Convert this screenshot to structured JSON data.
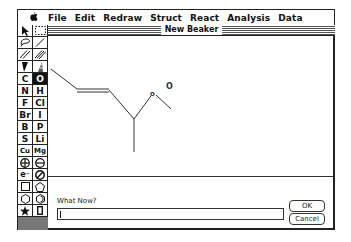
{
  "menubar": {
    "apple": "",
    "items": [
      {
        "label": "File"
      },
      {
        "label": "Edit"
      },
      {
        "label": "Redraw"
      },
      {
        "label": "Struct"
      },
      {
        "label": "React"
      },
      {
        "label": "Analysis"
      },
      {
        "label": "Data"
      }
    ]
  },
  "palette": {
    "tools": [
      {
        "name": "arrow-tool",
        "glyph": "arrow-icon"
      },
      {
        "name": "marquee-tool",
        "glyph": "marquee-icon"
      },
      {
        "name": "lasso-tool",
        "glyph": "lasso-icon"
      },
      {
        "name": "single-bond-tool",
        "glyph": "single-bond-icon"
      },
      {
        "name": "double-bond-tool",
        "glyph": "double-bond-icon"
      },
      {
        "name": "triple-bond-tool",
        "glyph": "triple-bond-icon"
      },
      {
        "name": "wedge-bond-tool",
        "glyph": "wedge-icon"
      },
      {
        "name": "hash-bond-tool",
        "glyph": "hash-wedge-icon"
      },
      {
        "name": "element-C",
        "label": "C"
      },
      {
        "name": "element-O",
        "label": "O",
        "selected": true
      },
      {
        "name": "element-N",
        "label": "N"
      },
      {
        "name": "element-H",
        "label": "H"
      },
      {
        "name": "element-F",
        "label": "F"
      },
      {
        "name": "element-Cl",
        "label": "Cl"
      },
      {
        "name": "element-Br",
        "label": "Br"
      },
      {
        "name": "element-I",
        "label": "I"
      },
      {
        "name": "element-B",
        "label": "B"
      },
      {
        "name": "element-P",
        "label": "P"
      },
      {
        "name": "element-S",
        "label": "S"
      },
      {
        "name": "element-Li",
        "label": "Li"
      },
      {
        "name": "element-Cu",
        "label": "Cu"
      },
      {
        "name": "element-Mg",
        "label": "Mg"
      },
      {
        "name": "positive-charge-tool",
        "glyph": "plus-circle-icon"
      },
      {
        "name": "negative-charge-tool",
        "glyph": "minus-circle-icon"
      },
      {
        "name": "electron-tool",
        "label": "e⁻"
      },
      {
        "name": "erase-tool",
        "glyph": "no-symbol-icon"
      },
      {
        "name": "square-ring-tool",
        "glyph": "square-icon"
      },
      {
        "name": "pentagon-ring-tool",
        "glyph": "pentagon-icon"
      },
      {
        "name": "hexagon-ring-tool",
        "glyph": "hexagon-icon"
      },
      {
        "name": "benzene-ring-tool",
        "glyph": "benzene-icon"
      },
      {
        "name": "star-tool",
        "glyph": "star-icon"
      },
      {
        "name": "rectangle-tool",
        "glyph": "rectangle-icon"
      }
    ]
  },
  "window": {
    "title": "New Beaker"
  },
  "molecule": {
    "atom_labels": [
      {
        "text": "o",
        "x": 152,
        "y": 72
      },
      {
        "text": "O",
        "x": 170,
        "y": 65
      }
    ]
  },
  "dialog": {
    "prompt": "What Now?",
    "input_value": "",
    "ok_label": "OK",
    "cancel_label": "Cancel"
  }
}
